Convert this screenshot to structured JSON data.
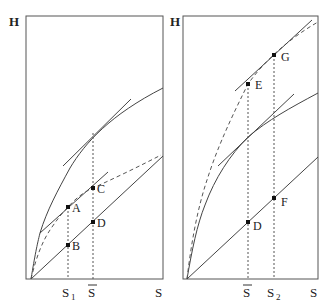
{
  "figure": {
    "colors": {
      "line": "#444444",
      "point": "#111111",
      "background": "#ffffff"
    }
  },
  "left_panel": {
    "y_axis_label": "H",
    "x_axis_label": "S",
    "x_ticks": [
      {
        "label": "S",
        "sub": "1",
        "overbar": false
      },
      {
        "label": "S",
        "sub": "",
        "overbar": true
      }
    ],
    "points": [
      {
        "label": "A"
      },
      {
        "label": "B"
      },
      {
        "label": "C"
      },
      {
        "label": "D"
      }
    ]
  },
  "right_panel": {
    "y_axis_label": "H",
    "x_axis_label": "S",
    "x_ticks": [
      {
        "label": "S",
        "sub": "",
        "overbar": true
      },
      {
        "label": "S",
        "sub": "2",
        "overbar": false
      }
    ],
    "points": [
      {
        "label": "E"
      },
      {
        "label": "G"
      },
      {
        "label": "D"
      },
      {
        "label": "F"
      }
    ]
  }
}
